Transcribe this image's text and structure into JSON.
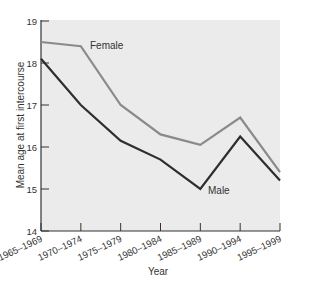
{
  "chart_data": {
    "type": "line",
    "title": "",
    "xlabel": "Year",
    "ylabel": "Mean age at first intercourse",
    "categories": [
      "1965–1969",
      "1970–1974",
      "1975–1979",
      "1980–1984",
      "1985–1989",
      "1990–1994",
      "1995–1999"
    ],
    "series": [
      {
        "name": "Female",
        "color": "#8a8a8a",
        "values": [
          18.5,
          18.4,
          17.0,
          16.3,
          16.05,
          16.7,
          15.4
        ]
      },
      {
        "name": "Male",
        "color": "#2e2e2e",
        "values": [
          18.1,
          17.0,
          16.15,
          15.7,
          15.0,
          16.25,
          15.2
        ]
      }
    ],
    "ylim": [
      14,
      19
    ],
    "yticks": [
      14,
      15,
      16,
      17,
      18,
      19
    ],
    "grid": false,
    "legend": "inline labels",
    "plot_background": "#ebebeb"
  },
  "labels": {
    "female": "Female",
    "male": "Male"
  }
}
